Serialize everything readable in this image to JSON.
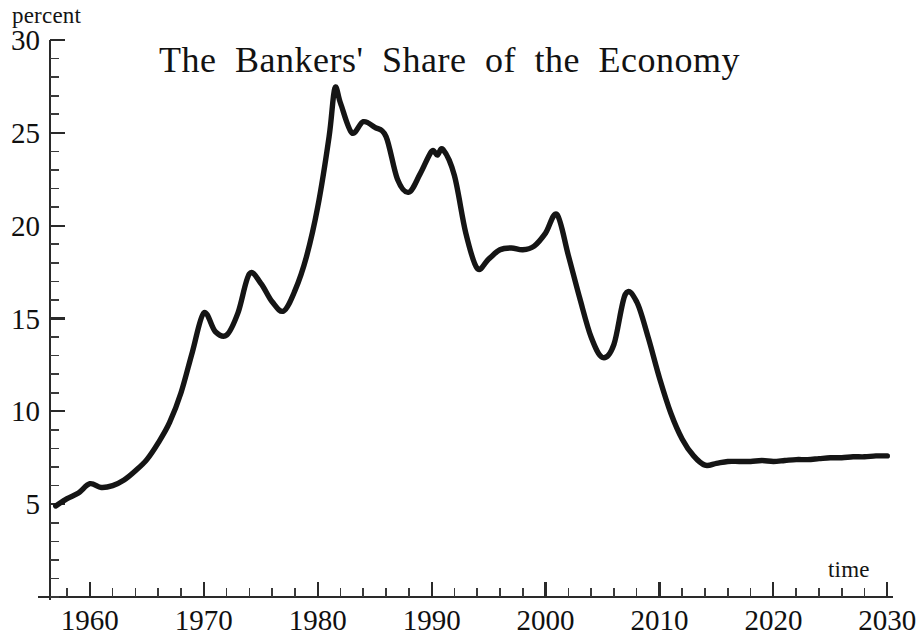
{
  "chart_data": {
    "type": "line",
    "title": "The Bankers' Share of the Economy",
    "xlabel": "time",
    "ylabel": "percent",
    "xlim": [
      1956.5,
      2030.5
    ],
    "ylim": [
      0,
      30
    ],
    "grid": false,
    "legend": null,
    "x_ticks": [
      1960,
      1970,
      1980,
      1990,
      2000,
      2010,
      2020,
      2030
    ],
    "x_tick_labels": [
      "1960",
      "1970",
      "1980",
      "1990",
      "2000",
      "2010",
      "2020",
      "2030"
    ],
    "x_minor_tick_step": 2,
    "y_ticks": [
      5,
      10,
      15,
      20,
      25,
      30
    ],
    "y_tick_labels": [
      "5",
      "10",
      "15",
      "20",
      "25",
      "30"
    ],
    "y_minor_tick_step": 1,
    "series": [
      {
        "name": "Bankers' share of the economy",
        "color": "#151515",
        "x": [
          1957,
          1958,
          1959,
          1960,
          1961,
          1962,
          1963,
          1964,
          1965,
          1966,
          1967,
          1968,
          1969,
          1970,
          1971,
          1972,
          1973,
          1974,
          1975,
          1976,
          1977,
          1978,
          1979,
          1980,
          1981,
          1981.5,
          1982,
          1983,
          1984,
          1985,
          1986,
          1987,
          1988,
          1989,
          1990,
          1990.5,
          1991,
          1992,
          1993,
          1994,
          1995,
          1996,
          1997,
          1998,
          1999,
          2000,
          2001,
          2002,
          2003,
          2004,
          2005,
          2006,
          2007,
          2008,
          2009,
          2010,
          2011,
          2012,
          2013,
          2014,
          2015,
          2016,
          2017,
          2018,
          2019,
          2020,
          2021,
          2022,
          2023,
          2024,
          2025,
          2026,
          2027,
          2028,
          2029,
          2030
        ],
        "y": [
          4.9,
          5.3,
          5.6,
          6.1,
          5.9,
          6.0,
          6.3,
          6.8,
          7.4,
          8.3,
          9.4,
          11.0,
          13.2,
          15.3,
          14.3,
          14.1,
          15.3,
          17.4,
          16.9,
          15.9,
          15.4,
          16.5,
          18.3,
          21.0,
          24.8,
          27.4,
          26.6,
          25.0,
          25.6,
          25.3,
          24.8,
          22.5,
          21.8,
          22.8,
          24.0,
          23.8,
          24.1,
          22.7,
          19.6,
          17.7,
          18.2,
          18.7,
          18.8,
          18.7,
          18.9,
          19.6,
          20.6,
          18.4,
          16.1,
          14.0,
          12.9,
          13.6,
          16.3,
          15.9,
          14.0,
          11.8,
          9.9,
          8.5,
          7.6,
          7.1,
          7.2,
          7.3,
          7.3,
          7.3,
          7.35,
          7.3,
          7.35,
          7.4,
          7.4,
          7.45,
          7.5,
          7.5,
          7.55,
          7.55,
          7.6,
          7.6
        ],
        "annotations": [
          {
            "label": "peak",
            "x": 1981.5,
            "y": 27.4
          },
          {
            "label": "trough",
            "x": 2014,
            "y": 7.1
          }
        ]
      }
    ]
  },
  "axes": {
    "y_unit_label": "percent",
    "x_unit_label": "time"
  }
}
